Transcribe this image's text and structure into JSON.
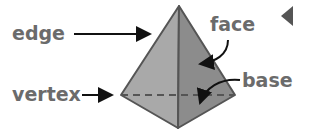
{
  "diagram": {
    "labels": {
      "edge": "edge",
      "face": "face",
      "vertex": "vertex",
      "base": "base"
    },
    "colors": {
      "left_face": "#a9a9a9",
      "right_face": "#8c8c8c",
      "outline": "#555555",
      "label": "#6b6b6b",
      "arrow": "#111111",
      "marker": "#555555"
    }
  }
}
